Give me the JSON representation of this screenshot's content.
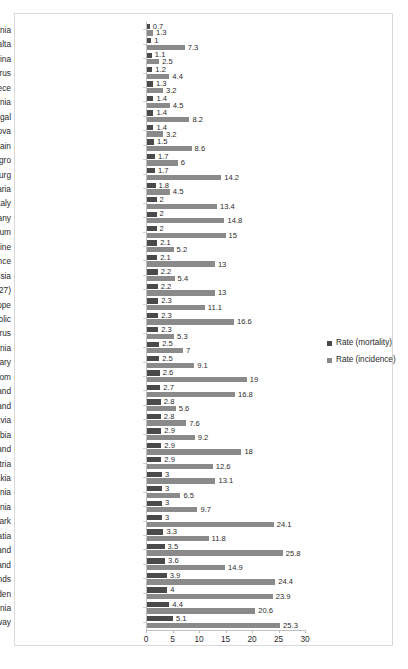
{
  "chart_data": {
    "type": "bar",
    "orientation": "horizontal",
    "title": "",
    "subtitle": "",
    "xlabel": "",
    "ylabel": "",
    "xlim": [
      0,
      30
    ],
    "xticks": [
      0,
      5,
      10,
      15,
      20,
      25,
      30
    ],
    "grid": false,
    "legend_position": "right",
    "colors": {
      "mortality": "#4a4a4a",
      "incidence": "#8a8a8a",
      "frame_border": "#d9d9d9",
      "axis": "#bfbfbf",
      "text": "#2b2b2b"
    },
    "categories": [
      "Albania",
      "Malta",
      "Bosnia and Herzegovina",
      "Cyprus",
      "Greece",
      "Romania",
      "Portugal",
      "Moldova",
      "Spain",
      "Montenegro",
      "Luxembourg",
      "Bulgaria",
      "Italy",
      "Germany",
      "Belgium",
      "Ukraine",
      "France",
      "Russia",
      "European Union (27)",
      "Europe",
      "Czech Republic",
      "Belarus",
      "Lithuania",
      "Hungary",
      "United Kingdom",
      "Finland",
      "Poland",
      "Latvia",
      "Serbia",
      "Ireland",
      "Austria",
      "Slovakia",
      "FYR Macedonia",
      "Estonia",
      "Denmark",
      "Croatia",
      "Switzerland",
      "Iceland",
      "Netherlands",
      "Sweden",
      "Slovenia",
      "Norway"
    ],
    "series": [
      {
        "name": "Rate (mortality)",
        "color": "#4a4a4a",
        "values": [
          0.7,
          1,
          1.1,
          1.2,
          1.3,
          1.4,
          1.4,
          1.4,
          1.5,
          1.7,
          1.7,
          1.8,
          2,
          2,
          2,
          2.1,
          2.1,
          2.2,
          2.2,
          2.3,
          2.3,
          2.3,
          2.5,
          2.5,
          2.6,
          2.7,
          2.8,
          2.8,
          2.9,
          2.9,
          2.9,
          3,
          3,
          3,
          3,
          3.3,
          3.5,
          3.6,
          3.9,
          4,
          4.4,
          5.1
        ]
      },
      {
        "name": "Rate (incidence)",
        "color": "#8a8a8a",
        "values": [
          1.3,
          7.3,
          2.5,
          4.4,
          3.2,
          4.5,
          8.2,
          3.2,
          8.6,
          6,
          14.2,
          4.5,
          13.4,
          14.8,
          15,
          5.2,
          13,
          5.4,
          13,
          11.1,
          16.6,
          5.3,
          7,
          9.1,
          19,
          16.8,
          5.6,
          7.6,
          9.2,
          18,
          12.6,
          13.1,
          6.5,
          9.7,
          24.1,
          11.8,
          25.8,
          14.9,
          24.4,
          23.9,
          20.6,
          25.3
        ]
      }
    ]
  },
  "legend": {
    "items": [
      {
        "label": "Rate (mortality)",
        "color": "#4a4a4a"
      },
      {
        "label": "Rate (incidence)",
        "color": "#8a8a8a"
      }
    ]
  }
}
